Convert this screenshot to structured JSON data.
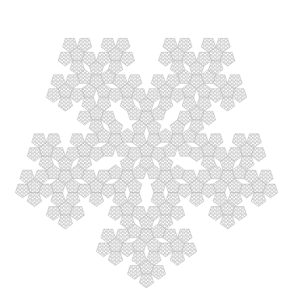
{
  "figure": {
    "title": "Fractal pentagon tiling (pentaflake snowflake)",
    "background": "#ffffff",
    "stroke_color": "#8a8a8a",
    "fill_color": "#d9d9d9",
    "cell_color": "#f4f4f4",
    "symmetry": 5,
    "orientation": "point-down",
    "recursion_depth": 3
  }
}
